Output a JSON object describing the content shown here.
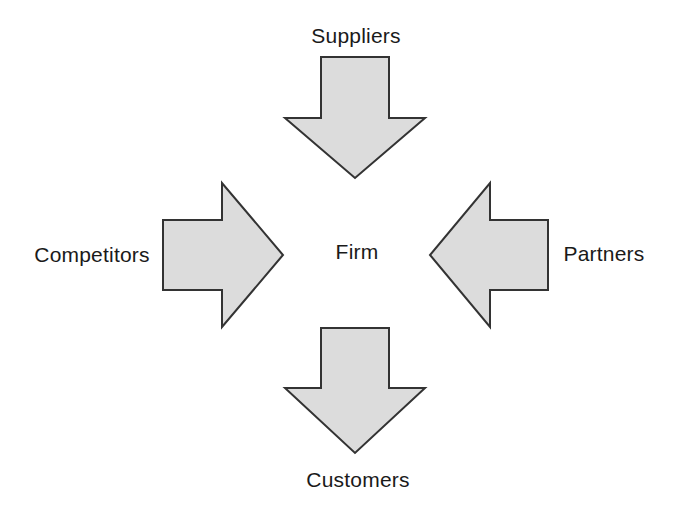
{
  "diagram": {
    "center": {
      "label": "Firm"
    },
    "nodes": [
      {
        "label": "Suppliers",
        "position": "top",
        "arrow_direction": "down"
      },
      {
        "label": "Competitors",
        "position": "left",
        "arrow_direction": "right"
      },
      {
        "label": "Partners",
        "position": "right",
        "arrow_direction": "left"
      },
      {
        "label": "Customers",
        "position": "bottom",
        "arrow_direction": "down"
      }
    ],
    "colors": {
      "arrow_fill": "#dcdcdc",
      "arrow_stroke": "#333333",
      "text": "#1a1a1a",
      "background": "#ffffff"
    }
  }
}
